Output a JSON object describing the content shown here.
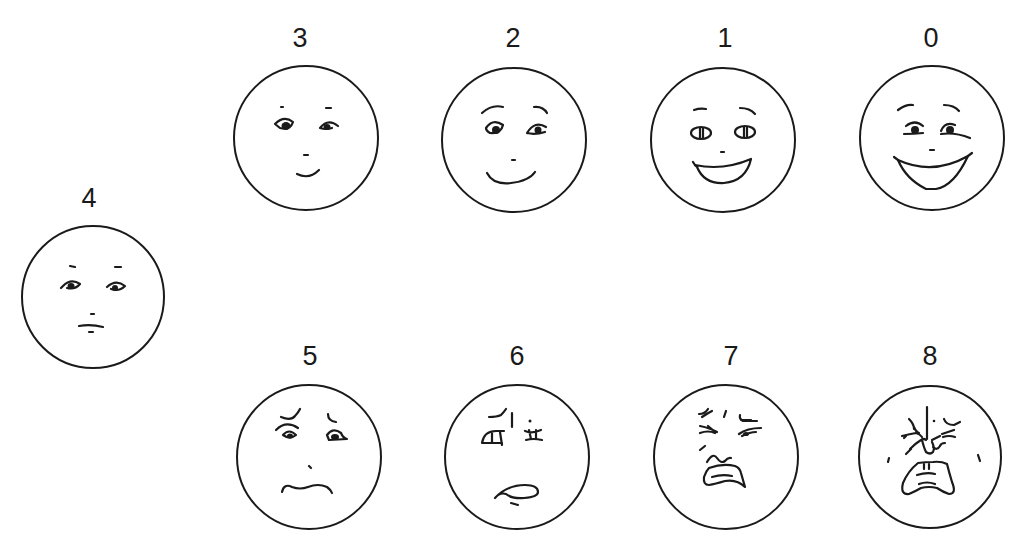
{
  "figure": {
    "stroke_color": "#1a1a1a",
    "background": "#ffffff"
  },
  "faces": [
    {
      "id": "face-4",
      "label": "4",
      "expression": "neutral"
    },
    {
      "id": "face-3",
      "label": "3",
      "expression": "slight smile"
    },
    {
      "id": "face-2",
      "label": "2",
      "expression": "smile"
    },
    {
      "id": "face-1",
      "label": "1",
      "expression": "open smile"
    },
    {
      "id": "face-0",
      "label": "0",
      "expression": "broad grin"
    },
    {
      "id": "face-5",
      "label": "5",
      "expression": "worried frown"
    },
    {
      "id": "face-6",
      "label": "6",
      "expression": "distressed grimace"
    },
    {
      "id": "face-7",
      "label": "7",
      "expression": "crying squint"
    },
    {
      "id": "face-8",
      "label": "8",
      "expression": "intense crying"
    }
  ]
}
